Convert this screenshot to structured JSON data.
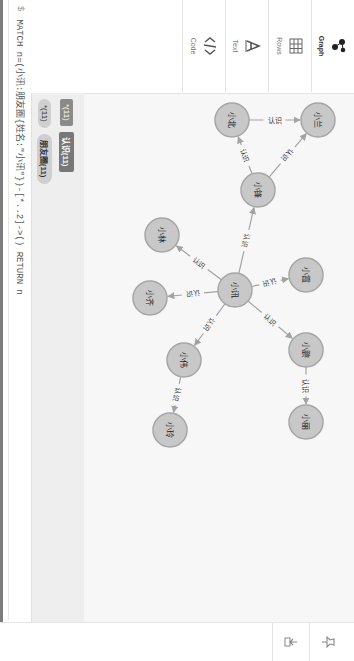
{
  "query": {
    "prompt": "$",
    "text": "MATCH n=(小讯:朋友圈{姓名:\"小讯\"})-[*..2]->() RETURN n"
  },
  "sidebar": {
    "tabs": [
      {
        "label": "Graph",
        "icon": "graph-icon",
        "active": true
      },
      {
        "label": "Rows",
        "icon": "table-icon",
        "active": false
      },
      {
        "label": "Text",
        "icon": "text-icon",
        "active": false
      },
      {
        "label": "Code",
        "icon": "code-icon",
        "active": false
      }
    ]
  },
  "legend": {
    "node_labels": [
      {
        "label": "*(11)"
      },
      {
        "label": "朋友圈(11)"
      }
    ],
    "relationship_types": [
      {
        "label": "*(11)"
      },
      {
        "label": "认识(11)"
      }
    ]
  },
  "right_toolbar": {
    "buttons": [
      {
        "icon": "pin-icon"
      },
      {
        "icon": "export-icon"
      }
    ]
  },
  "graph": {
    "node_color": "#c8c8c8",
    "node_stroke": "#a6a6a6",
    "edge_color": "#a3a3a3",
    "nodes": [
      {
        "id": "xiaoxun",
        "name": "小讯",
        "x": 290,
        "y": 119
      },
      {
        "id": "xiaofeng",
        "name": "小锋",
        "x": 190,
        "y": 96
      },
      {
        "id": "xiaobei",
        "name": "小北",
        "x": 120,
        "y": 122
      },
      {
        "id": "xiaolan",
        "name": "小兰",
        "x": 120,
        "y": 36
      },
      {
        "id": "xiaolin",
        "name": "小林",
        "x": 235,
        "y": 192
      },
      {
        "id": "xiaoqi",
        "name": "小齐",
        "x": 298,
        "y": 204
      },
      {
        "id": "xiaowei",
        "name": "小伟",
        "x": 360,
        "y": 170
      },
      {
        "id": "xiaoling",
        "name": "小玲",
        "x": 430,
        "y": 184
      },
      {
        "id": "xiaoxia",
        "name": "小霞",
        "x": 275,
        "y": 48
      },
      {
        "id": "xiaopeng",
        "name": "小鹏",
        "x": 350,
        "y": 48
      },
      {
        "id": "xiaoli",
        "name": "小丽",
        "x": 422,
        "y": 48
      }
    ],
    "edges": [
      {
        "from": "xiaoxun",
        "to": "xiaofeng",
        "label": "认识"
      },
      {
        "from": "xiaoxun",
        "to": "xiaolin",
        "label": "认识"
      },
      {
        "from": "xiaoxun",
        "to": "xiaoqi",
        "label": "认识"
      },
      {
        "from": "xiaoxun",
        "to": "xiaowei",
        "label": "认识"
      },
      {
        "from": "xiaoxun",
        "to": "xiaoxia",
        "label": "认识"
      },
      {
        "from": "xiaoxun",
        "to": "xiaopeng",
        "label": "认识"
      },
      {
        "from": "xiaofeng",
        "to": "xiaobei",
        "label": "认识"
      },
      {
        "from": "xiaofeng",
        "to": "xiaolan",
        "label": "认识"
      },
      {
        "from": "xiaobei",
        "to": "xiaolan",
        "label": "认识"
      },
      {
        "from": "xiaowei",
        "to": "xiaoling",
        "label": "认识"
      },
      {
        "from": "xiaopeng",
        "to": "xiaoli",
        "label": "认识"
      }
    ]
  }
}
